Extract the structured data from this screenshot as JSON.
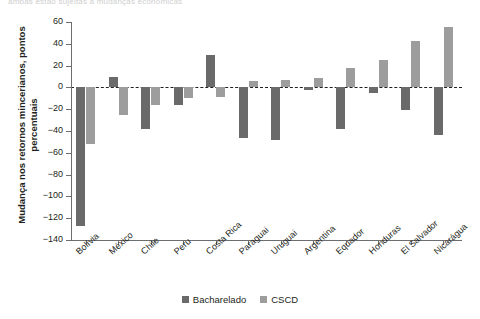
{
  "top_fragment": "ambas estão sujeitas a mudanças econômicas",
  "chart_data": {
    "type": "bar",
    "title": "",
    "xlabel": "",
    "ylabel": "Mudança nos retornos mincerianos, pontos percentuais",
    "ylim": [
      -140,
      60
    ],
    "ytick_step": 20,
    "yticks": [
      60,
      40,
      20,
      0,
      -20,
      -40,
      -60,
      -80,
      -100,
      -120,
      -140
    ],
    "ytick_labels": [
      "60",
      "40",
      "20",
      "0",
      "−20",
      "−40",
      "−60",
      "−80",
      "−100",
      "−120",
      "−140"
    ],
    "grid": false,
    "zero_line": true,
    "legend_position": "bottom-center",
    "categories": [
      "Bolívia",
      "México",
      "Chile",
      "Peru",
      "Costa Rica",
      "Paraguai",
      "Uruguai",
      "Argentina",
      "Equador",
      "Honduras",
      "El Salvador",
      "Nicarágua"
    ],
    "series": [
      {
        "name": "Bacharelado",
        "color": "#6a6a6a",
        "values": [
          -127,
          10,
          -38,
          -16,
          30,
          -46,
          -48,
          -2,
          -38,
          -5,
          -21,
          -44
        ]
      },
      {
        "name": "CSCD",
        "color": "#9d9d9d",
        "values": [
          -52,
          -25,
          -16,
          -10,
          -9,
          6,
          7,
          9,
          18,
          25,
          43,
          55
        ]
      }
    ]
  },
  "legend": {
    "items": [
      {
        "label": "Bacharelado",
        "color": "#6a6a6a"
      },
      {
        "label": "CSCD",
        "color": "#9d9d9d"
      }
    ]
  }
}
